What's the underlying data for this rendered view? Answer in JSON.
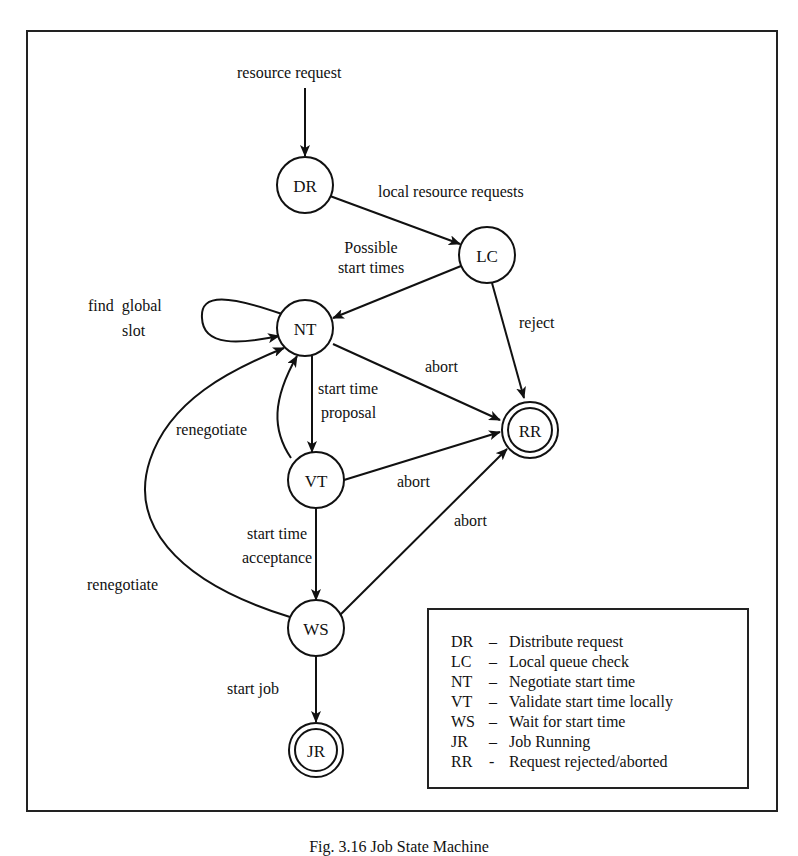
{
  "diagram": {
    "type": "state-machine",
    "entry_label": "resource request",
    "nodes": [
      {
        "id": "DR",
        "label": "DR",
        "final": false
      },
      {
        "id": "LC",
        "label": "LC",
        "final": false
      },
      {
        "id": "NT",
        "label": "NT",
        "final": false
      },
      {
        "id": "VT",
        "label": "VT",
        "final": false
      },
      {
        "id": "WS",
        "label": "WS",
        "final": false
      },
      {
        "id": "JR",
        "label": "JR",
        "final": true
      },
      {
        "id": "RR",
        "label": "RR",
        "final": true
      }
    ],
    "edges": [
      {
        "from": "start",
        "to": "DR",
        "label": "resource request"
      },
      {
        "from": "DR",
        "to": "LC",
        "label": "local resource requests"
      },
      {
        "from": "LC",
        "to": "NT",
        "label_line1": "Possible",
        "label_line2": "start times"
      },
      {
        "from": "LC",
        "to": "RR",
        "label": "reject"
      },
      {
        "from": "NT",
        "to": "NT",
        "label_line1": "find  global",
        "label_line2": "slot"
      },
      {
        "from": "NT",
        "to": "RR",
        "label": "abort"
      },
      {
        "from": "NT",
        "to": "VT",
        "label_line1": "start time",
        "label_line2": "proposal"
      },
      {
        "from": "VT",
        "to": "NT",
        "label": "renegotiate"
      },
      {
        "from": "VT",
        "to": "RR",
        "label": "abort"
      },
      {
        "from": "VT",
        "to": "WS",
        "label_line1": "start time",
        "label_line2": "acceptance"
      },
      {
        "from": "WS",
        "to": "NT",
        "label": "renegotiate"
      },
      {
        "from": "WS",
        "to": "RR",
        "label": "abort"
      },
      {
        "from": "WS",
        "to": "JR",
        "label": "start job"
      }
    ]
  },
  "legend": [
    {
      "abbr": "DR",
      "sep": "–",
      "text": "Distribute request"
    },
    {
      "abbr": "LC",
      "sep": "–",
      "text": "Local queue check"
    },
    {
      "abbr": "NT",
      "sep": "–",
      "text": "Negotiate start time"
    },
    {
      "abbr": "VT",
      "sep": "–",
      "text": "Validate start time locally"
    },
    {
      "abbr": "WS",
      "sep": "–",
      "text": "Wait for start time"
    },
    {
      "abbr": "JR",
      "sep": "–",
      "text": "Job Running"
    },
    {
      "abbr": "RR",
      "sep": "-",
      "text": "Request rejected/aborted"
    }
  ],
  "caption": "Fig. 3.16 Job State Machine"
}
